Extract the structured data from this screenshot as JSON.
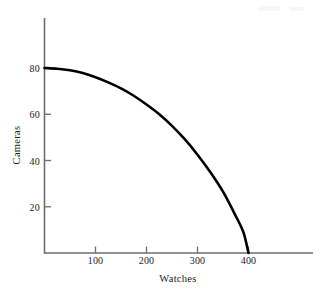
{
  "figure": {
    "background_color": "#ffffff",
    "curve_color": "#000000",
    "axis_color": "#6d6d6d",
    "text_color": "#1a1a1a"
  },
  "chart_data": {
    "type": "line",
    "title": "",
    "subtitle": "",
    "xlabel": "Watches",
    "ylabel": "Cameras",
    "xlim": [
      0,
      520
    ],
    "ylim": [
      0,
      92
    ],
    "grid": false,
    "legend": null,
    "annotations": [],
    "x_ticks": [
      100,
      200,
      300,
      400
    ],
    "x_tick_labels": [
      "100",
      "200",
      "300",
      "400"
    ],
    "y_ticks": [
      20,
      40,
      60,
      80
    ],
    "y_tick_labels": [
      "20",
      "40",
      "60",
      "80"
    ],
    "series": [
      {
        "name": "Production possibilities frontier",
        "x": [
          0,
          25,
          50,
          75,
          100,
          125,
          150,
          175,
          200,
          225,
          250,
          275,
          300,
          325,
          350,
          375,
          390,
          400
        ],
        "y": [
          80,
          79.7,
          79.0,
          77.8,
          76.0,
          73.8,
          71.2,
          68.0,
          64.2,
          60.0,
          55.0,
          49.2,
          42.5,
          35.0,
          26.5,
          16.0,
          9.0,
          0
        ]
      }
    ]
  }
}
